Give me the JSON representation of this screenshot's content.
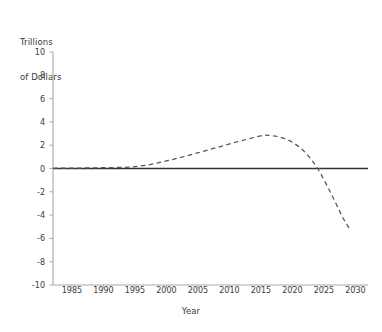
{
  "chart_data": {
    "type": "line",
    "title": "",
    "ylabel": "Trillions\nof Dollars",
    "ylabel_line1": "Trillions",
    "ylabel_line2": "of Dollars",
    "xlabel": "Year",
    "xlim": [
      1982,
      2032
    ],
    "ylim": [
      -10,
      10
    ],
    "ytick_labels": [
      "10",
      "8",
      "6",
      "4",
      "2",
      "0",
      "-2",
      "-4",
      "-6",
      "-8",
      "-10"
    ],
    "ytick_values": [
      10,
      8,
      6,
      4,
      2,
      0,
      -2,
      -4,
      -6,
      -8,
      -10
    ],
    "xtick_labels": [
      "1985",
      "1990",
      "1995",
      "2000",
      "2005",
      "2010",
      "2015",
      "2020",
      "2025",
      "2030"
    ],
    "xtick_values": [
      1985,
      1990,
      1995,
      2000,
      2005,
      2010,
      2015,
      2020,
      2025,
      2030
    ],
    "grid": false,
    "legend": "none",
    "line_style": "dashed",
    "line_color": "#555555",
    "zero_line_color": "#333333",
    "axis_color": "#aaaaaa",
    "series": [
      {
        "name": "Projection",
        "style": "dashed",
        "x": [
          1982,
          1985,
          1988,
          1991,
          1994,
          1997,
          2000,
          2003,
          2006,
          2009,
          2012,
          2015,
          2016,
          2018,
          2020,
          2022,
          2024,
          2026,
          2028,
          2029
        ],
        "values": [
          0.02,
          0.03,
          0.05,
          0.08,
          0.12,
          0.3,
          0.65,
          1.05,
          1.5,
          1.95,
          2.4,
          2.8,
          2.85,
          2.7,
          2.25,
          1.4,
          0.0,
          -2.0,
          -4.2,
          -5.1
        ]
      }
    ]
  }
}
